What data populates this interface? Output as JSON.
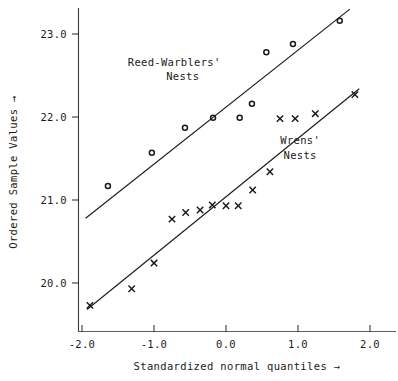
{
  "chart_data": {
    "type": "scatter",
    "title": "",
    "xlabel": "Standardized normal quantiles →",
    "ylabel": "Ordered Sample Values →",
    "xlim": [
      -2.35,
      2.4
    ],
    "ylim": [
      19.55,
      23.35
    ],
    "xticks": [
      -2.0,
      -1.0,
      0.0,
      1.0,
      2.0
    ],
    "xticklabels": [
      "-2.0",
      "-1.0",
      "0.0",
      "1.0",
      "2.0"
    ],
    "yticks": [
      20.0,
      21.0,
      22.0,
      23.0
    ],
    "yticklabels": [
      "20.0",
      "21.0",
      "22.0",
      "23.0"
    ],
    "grid": false,
    "legend_position": "inline-annotations",
    "series": [
      {
        "name": "Reed-Warblers' Nests",
        "marker": "circle",
        "annotation": "Reed-Warblers'\nNests",
        "annotation_line1": "Reed-Warblers'",
        "annotation_line2": "Nests",
        "color": "#1a1a1a",
        "x": [
          -1.64,
          -1.03,
          -0.57,
          -0.18,
          0.19,
          0.36,
          0.56,
          0.93,
          1.58
        ],
        "y": [
          21.17,
          21.57,
          21.87,
          21.99,
          21.99,
          22.16,
          22.78,
          22.88,
          23.16
        ],
        "fit_line": {
          "x0": -1.95,
          "y0": 20.78,
          "x1": 1.72,
          "y1": 23.3
        }
      },
      {
        "name": "Wrens' Nests",
        "marker": "cross",
        "annotation": "Wrens'\nNests",
        "annotation_line1": "Wrens'",
        "annotation_line2": "Nests",
        "color": "#1a1a1a",
        "x": [
          -1.89,
          -1.31,
          -1.0,
          -0.75,
          -0.56,
          -0.36,
          -0.19,
          0.0,
          0.17,
          0.37,
          0.61,
          0.75,
          0.96,
          1.24,
          1.79
        ],
        "y": [
          19.73,
          19.93,
          20.24,
          20.77,
          20.85,
          20.88,
          20.94,
          20.93,
          20.93,
          21.12,
          21.34,
          21.98,
          21.98,
          22.04,
          22.27
        ],
        "fit_line": {
          "x0": -1.93,
          "y0": 19.68,
          "x1": 1.85,
          "y1": 22.34
        }
      }
    ],
    "annotations": [
      {
        "text": "Reed-Warblers'",
        "x": -0.72,
        "y": 22.62
      },
      {
        "text": "Nests",
        "x": -0.6,
        "y": 22.45
      },
      {
        "text": "Wrens'",
        "x": 1.03,
        "y": 21.67
      },
      {
        "text": "Nests",
        "x": 1.03,
        "y": 21.5
      }
    ]
  }
}
